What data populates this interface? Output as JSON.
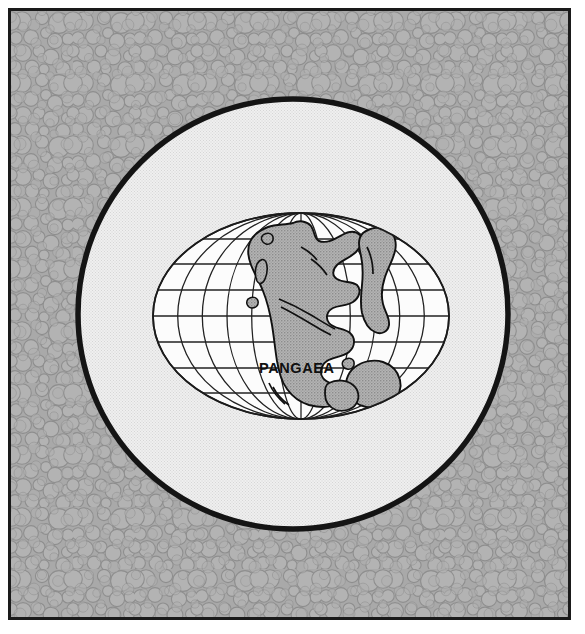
{
  "figure": {
    "kind": "map-illustration",
    "projection": "Mollweide (elliptical equal-area)",
    "frame": {
      "border_color": "#1a1a1a",
      "margin_color": "#ffffff"
    }
  },
  "background": {
    "name": "pebble-texture",
    "base_color": "#a9a9a9",
    "pebble_fill": "#b2b2b2",
    "pebble_stroke": "#8f8f8f",
    "description": "Irregular packed circles / pebble stipple pattern"
  },
  "disc": {
    "name": "globe-disc",
    "fill": "#ededed",
    "halftone": "#dcdcdc",
    "outline_color": "#141414",
    "outline_width_px": 5,
    "center_x": 282,
    "center_y": 310,
    "radius": 218
  },
  "map": {
    "name": "mollweide-map",
    "ocean_fill": "#fcfcfc",
    "land_fill": "#a8a8a8",
    "land_stroke": "#111111",
    "graticule_color": "#1e1e1e",
    "graticule_width_px": 1.2,
    "bounds": {
      "left": 150,
      "right": 446,
      "top": 210,
      "bottom": 416
    },
    "meridian_interval_deg": 30,
    "parallel_interval_deg": 30,
    "labels": [
      {
        "name": "continent-label-pangaea",
        "text": "PANGAEA",
        "x": 248,
        "y": 349
      }
    ]
  },
  "colors": {
    "ink": "#111111",
    "land": "#a8a8a8",
    "ocean": "#fcfcfc",
    "disc": "#ededed",
    "pebbles": "#b2b2b2"
  }
}
